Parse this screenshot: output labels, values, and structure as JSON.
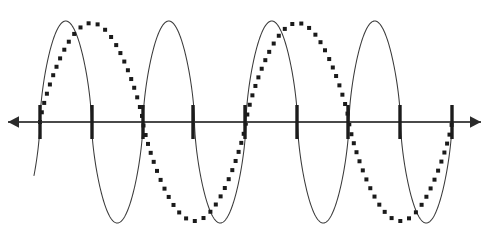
{
  "figure": {
    "background_color": "#ffffff",
    "width": 489,
    "height": 243
  },
  "axis": {
    "name": "horizontal-axis",
    "y": 122,
    "x_start": 8,
    "x_end": 481,
    "color": "#4a4a4a",
    "stroke_width": 2.1,
    "left_arrow": true,
    "right_arrow": true,
    "arrow_color": "#2b2b2b",
    "arrow_size": 11
  },
  "ticks": {
    "name": "axis-ticks",
    "color": "#1c1c1c",
    "stroke_width": 3.4,
    "half_height": 17,
    "positions": [
      40,
      92,
      143,
      193,
      245,
      297,
      348,
      400,
      452
    ],
    "count": 9,
    "spacing": 51.5
  },
  "chart_data": {
    "type": "line",
    "xlabel": "",
    "ylabel": "",
    "grid": false,
    "legend": false,
    "axis_y_pixel": 122,
    "xlim": [
      8,
      481
    ],
    "ylim": [
      243,
      0
    ],
    "series": [
      {
        "name": "solid-wave",
        "style": "solid",
        "color": "#3a3a3a",
        "stroke_width": 1.05,
        "amplitude": 101,
        "wavelength": 103,
        "phase_x_zero": 40,
        "baseline_y": 122,
        "peak_y": 21,
        "trough_y": 236,
        "lobe_shape": "narrow-elliptical",
        "zero_crossings": [
          40,
          75,
          92,
          127,
          143,
          178,
          195,
          230,
          246,
          281,
          297,
          332,
          349,
          384,
          400,
          435,
          452
        ],
        "peaks_x": [
          57,
          109,
          161,
          213,
          264,
          316,
          368,
          419
        ],
        "troughs_x": [
          92,
          143,
          195,
          246,
          298,
          350,
          401
        ]
      },
      {
        "name": "dotted-wave",
        "style": "dotted",
        "color": "#1a1a1a",
        "dot_size": 4,
        "dot_spacing": 9,
        "amplitude": 99,
        "wavelength": 206,
        "phase_x_zero": 40,
        "baseline_y": 122,
        "peak_y": 23,
        "trough_y": 238,
        "lobe_shape": "broad-elliptical",
        "zero_crossings": [
          40,
          143,
          245,
          348,
          452
        ],
        "peaks_x": [
          194,
          400
        ],
        "troughs_x": [
          91,
          297
        ]
      }
    ]
  }
}
